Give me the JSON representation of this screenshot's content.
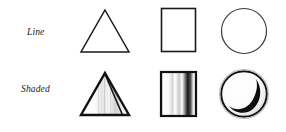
{
  "figure": {
    "title": "",
    "background_color": "#ffffff",
    "stroke_color": "#1a1a1a",
    "rows": [
      {
        "id": "line",
        "label": "Line",
        "style": "line",
        "cells": [
          {
            "id": "line-triangle",
            "shape": "triangle",
            "icon_name": "triangle-outline-icon",
            "fill": "none",
            "stroke_width": "thin"
          },
          {
            "id": "line-rectangle",
            "shape": "rectangle",
            "icon_name": "rectangle-outline-icon",
            "fill": "none",
            "stroke_width": "thin"
          },
          {
            "id": "line-circle",
            "shape": "circle",
            "icon_name": "circle-outline-icon",
            "fill": "none",
            "stroke_width": "thin"
          }
        ]
      },
      {
        "id": "shaded",
        "label": "Shaded",
        "style": "shaded",
        "cells": [
          {
            "id": "shaded-triangle",
            "shape": "triangle",
            "icon_name": "triangle-shaded-icon",
            "fill": "gradient",
            "stroke_width": "thick"
          },
          {
            "id": "shaded-rectangle",
            "shape": "rectangle",
            "icon_name": "rectangle-shaded-icon",
            "fill": "gradient",
            "stroke_width": "thick"
          },
          {
            "id": "shaded-circle",
            "shape": "circle",
            "icon_name": "circle-shaded-icon",
            "fill": "gradient",
            "stroke_width": "thick"
          }
        ]
      }
    ]
  }
}
